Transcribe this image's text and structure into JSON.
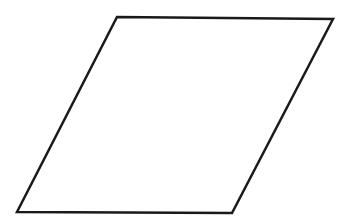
{
  "canvas": {
    "width": 339,
    "height": 217,
    "background_color": "#ffffff"
  },
  "figure": {
    "name": "parallelogram",
    "shape_type": "parallelogram",
    "stroke_color": "#1a1a1a",
    "fill_color": "#ffffff",
    "stroke_width": 2.5,
    "vertices": [
      {
        "label": "top-left",
        "x": 117,
        "y": 17
      },
      {
        "label": "top-right",
        "x": 333,
        "y": 19
      },
      {
        "label": "bottom-right",
        "x": 232,
        "y": 213
      },
      {
        "label": "bottom-left",
        "x": 17,
        "y": 212
      }
    ],
    "points_attr": "117,17 333,19 232,213 17,212"
  }
}
